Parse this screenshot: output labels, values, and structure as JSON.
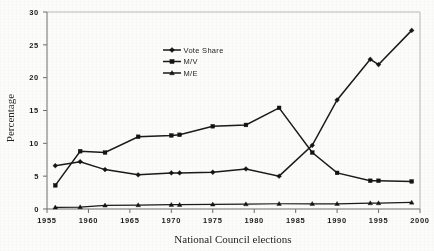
{
  "chart_data": {
    "type": "line",
    "title": "",
    "xlabel": "National Council elections",
    "ylabel": "Percentage",
    "xlim": [
      1955,
      2000
    ],
    "ylim": [
      0,
      30
    ],
    "ytick_step": 5,
    "xtick_step": 5,
    "xticks": [
      "1955",
      "1960",
      "1965",
      "1970",
      "1975",
      "1980",
      "1985",
      "1990",
      "1995",
      "2000"
    ],
    "yticks": [
      "0",
      "5",
      "10",
      "15",
      "20",
      "25",
      "30"
    ],
    "grid": false,
    "legend_position": "upper-center",
    "x": [
      1956,
      1959,
      1962,
      1966,
      1970,
      1971,
      1975,
      1979,
      1983,
      1987,
      1990,
      1994,
      1995,
      1999
    ],
    "series": [
      {
        "name": "Vote Share",
        "marker": "diamond",
        "values": [
          6.6,
          7.2,
          6.0,
          5.2,
          5.5,
          5.5,
          5.6,
          6.1,
          5.0,
          9.7,
          16.6,
          22.8,
          22.0,
          27.2
        ]
      },
      {
        "name": "M/V",
        "marker": "square",
        "values": [
          3.6,
          8.8,
          8.6,
          11.0,
          11.2,
          11.3,
          12.6,
          12.8,
          15.4,
          8.6,
          5.5,
          4.3,
          4.3,
          4.2
        ]
      },
      {
        "name": "M/E",
        "marker": "triangle",
        "values": [
          0.25,
          0.3,
          0.55,
          0.6,
          0.65,
          0.65,
          0.7,
          0.75,
          0.8,
          0.8,
          0.8,
          0.9,
          0.9,
          1.0
        ]
      }
    ]
  },
  "legend": {
    "items": [
      {
        "label": "Vote  Share",
        "marker": "diamond"
      },
      {
        "label": "M/V",
        "marker": "square"
      },
      {
        "label": "M/E",
        "marker": "triangle"
      }
    ]
  }
}
